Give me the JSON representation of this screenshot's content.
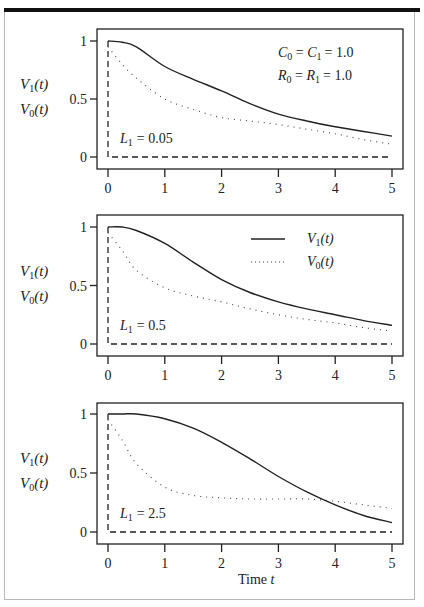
{
  "figure": {
    "xlabel": "Time ",
    "xlabel_var": "t",
    "ylabel_lines": [
      {
        "var": "V",
        "sub": "1",
        "arg": "(t)"
      },
      {
        "var": "V",
        "sub": "0",
        "arg": "(t)"
      }
    ],
    "parameters": {
      "line1": {
        "a": "C",
        "a_sub": "0",
        "b": "C",
        "b_sub": "1",
        "value": "= 1.0"
      },
      "line2": {
        "a": "R",
        "a_sub": "0",
        "b": "R",
        "b_sub": "1",
        "value": "= 1.0"
      }
    },
    "legend": [
      {
        "label_var": "V",
        "label_sub": "1",
        "label_arg": "(t)",
        "style": "solid"
      },
      {
        "label_var": "V",
        "label_sub": "0",
        "label_arg": "(t)",
        "style": "dotted"
      }
    ],
    "x_ticks": [
      "0",
      "1",
      "2",
      "3",
      "4",
      "5"
    ],
    "y_ticks": [
      "0",
      "0.5",
      "1"
    ]
  },
  "chart_data": [
    {
      "type": "line",
      "title": "",
      "annotation": "L1 = 0.05",
      "annotation_value": "= 0.05",
      "xlabel": "",
      "ylabel": "V1(t), V0(t)",
      "xlim": [
        0,
        5
      ],
      "ylim": [
        0,
        1
      ],
      "grid": false,
      "x": [
        0,
        0.25,
        0.5,
        1,
        1.5,
        2,
        2.5,
        3,
        3.5,
        4,
        4.5,
        5
      ],
      "series": [
        {
          "name": "V1(t)",
          "style": "solid",
          "values": [
            1.0,
            0.99,
            0.95,
            0.78,
            0.67,
            0.57,
            0.46,
            0.37,
            0.31,
            0.26,
            0.22,
            0.18
          ]
        },
        {
          "name": "V0(t)",
          "style": "dotted",
          "values": [
            0.95,
            0.8,
            0.68,
            0.5,
            0.41,
            0.34,
            0.31,
            0.28,
            0.24,
            0.2,
            0.15,
            0.11
          ]
        },
        {
          "name": "input step",
          "style": "dashed",
          "values": "step: vertical at t=0 from 1 to 0, then 0"
        }
      ],
      "legend_position": "none"
    },
    {
      "type": "line",
      "title": "",
      "annotation": "L1 = 0.5",
      "annotation_value": "= 0.5",
      "xlabel": "",
      "ylabel": "V1(t), V0(t)",
      "xlim": [
        0,
        5
      ],
      "ylim": [
        0,
        1
      ],
      "grid": false,
      "x": [
        0,
        0.25,
        0.5,
        1,
        1.5,
        2,
        2.5,
        3,
        3.5,
        4,
        4.5,
        5
      ],
      "series": [
        {
          "name": "V1(t)",
          "style": "solid",
          "values": [
            1.0,
            1.0,
            0.97,
            0.86,
            0.7,
            0.55,
            0.44,
            0.36,
            0.3,
            0.25,
            0.2,
            0.16
          ]
        },
        {
          "name": "V0(t)",
          "style": "dotted",
          "values": [
            0.95,
            0.8,
            0.63,
            0.48,
            0.41,
            0.36,
            0.3,
            0.25,
            0.21,
            0.18,
            0.14,
            0.11
          ]
        },
        {
          "name": "input step",
          "style": "dashed",
          "values": "step: vertical at t=0 from 1 to 0, then 0"
        }
      ],
      "legend_position": "upper right"
    },
    {
      "type": "line",
      "title": "",
      "annotation": "L1 = 2.5",
      "annotation_value": "= 2.5",
      "xlabel": "Time t",
      "ylabel": "V1(t), V0(t)",
      "xlim": [
        0,
        5
      ],
      "ylim": [
        0,
        1
      ],
      "grid": false,
      "x": [
        0,
        0.25,
        0.5,
        1,
        1.5,
        2,
        2.5,
        3,
        3.5,
        4,
        4.5,
        5
      ],
      "series": [
        {
          "name": "V1(t)",
          "style": "solid",
          "values": [
            1.0,
            1.0,
            1.0,
            0.96,
            0.88,
            0.76,
            0.62,
            0.47,
            0.34,
            0.23,
            0.14,
            0.08
          ]
        },
        {
          "name": "V0(t)",
          "style": "dotted",
          "values": [
            0.95,
            0.78,
            0.58,
            0.38,
            0.31,
            0.29,
            0.28,
            0.28,
            0.28,
            0.26,
            0.23,
            0.2
          ]
        },
        {
          "name": "input step",
          "style": "dashed",
          "values": "step: vertical at t=0 from 1 to 0, then 0"
        }
      ],
      "legend_position": "none"
    }
  ]
}
